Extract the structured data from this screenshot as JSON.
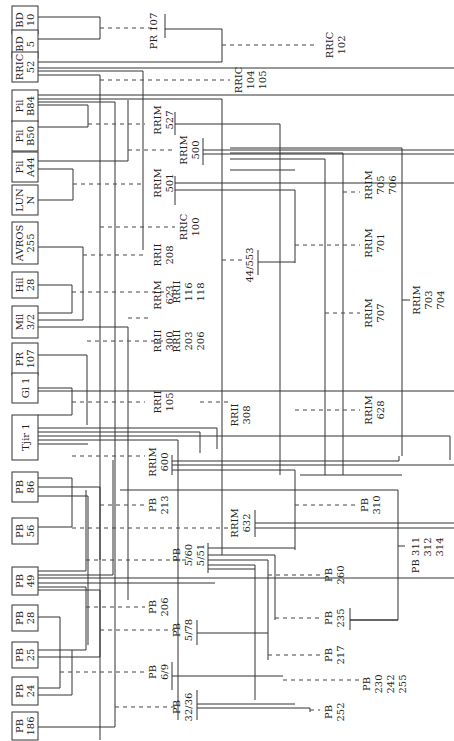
{
  "diagram": {
    "orientation": "rotated-90-ccw",
    "clones": [
      {
        "id": "bd10",
        "line1": "BD",
        "line2": "10"
      },
      {
        "id": "bd5",
        "line1": "BD",
        "line2": "5"
      },
      {
        "id": "rric52",
        "line1": "RRIC",
        "line2": "52"
      },
      {
        "id": "pilb84",
        "line1": "Pil",
        "line2": "B84"
      },
      {
        "id": "pilb50",
        "line1": "Pil",
        "line2": "B50"
      },
      {
        "id": "pila44",
        "line1": "Pil",
        "line2": "A44"
      },
      {
        "id": "lunn",
        "line1": "LUN",
        "line2": "N"
      },
      {
        "id": "avros255",
        "line1": "AVROS",
        "line2": "255"
      },
      {
        "id": "hil28",
        "line1": "Hil",
        "line2": "28"
      },
      {
        "id": "mil32",
        "line1": "Mil",
        "line2": "3/2"
      },
      {
        "id": "pr107",
        "line1": "PR",
        "line2": "107"
      },
      {
        "id": "gl1",
        "line1": "Gl 1",
        "line2": ""
      },
      {
        "id": "tjir1",
        "line1": "Tjir 1",
        "line2": ""
      },
      {
        "id": "pb86",
        "line1": "PB",
        "line2": "86"
      },
      {
        "id": "pb56",
        "line1": "PB",
        "line2": "56"
      },
      {
        "id": "pb49",
        "line1": "PB",
        "line2": "49"
      },
      {
        "id": "pb28",
        "line1": "PB",
        "line2": "28"
      },
      {
        "id": "pb25",
        "line1": "PB",
        "line2": "25"
      },
      {
        "id": "pb24",
        "line1": "PB",
        "line2": "24"
      },
      {
        "id": "pb186",
        "line1": "PB",
        "line2": "186"
      }
    ],
    "offspring_labels": [
      {
        "id": "pr107b",
        "lines": [
          "PR 107"
        ]
      },
      {
        "id": "rric102",
        "lines": [
          "RRIC",
          "102"
        ]
      },
      {
        "id": "rric104",
        "lines": [
          "RRIC",
          "104",
          "105"
        ]
      },
      {
        "id": "rrim527",
        "lines": [
          "RRIM",
          "527"
        ]
      },
      {
        "id": "rrim500",
        "lines": [
          "RRIM",
          "500"
        ]
      },
      {
        "id": "rrim501",
        "lines": [
          "RRIM",
          "501"
        ]
      },
      {
        "id": "rric100",
        "lines": [
          "RRIC",
          "100"
        ]
      },
      {
        "id": "rrii208",
        "lines": [
          "RRII",
          "208"
        ]
      },
      {
        "id": "rrim705",
        "lines": [
          "RRIM",
          "705",
          "706"
        ]
      },
      {
        "id": "rrim701",
        "lines": [
          "RRIM",
          "701"
        ]
      },
      {
        "id": "c44553",
        "lines": [
          "44/553"
        ]
      },
      {
        "id": "rrim623",
        "lines": [
          "RRIM",
          "623"
        ]
      },
      {
        "id": "rrii116",
        "lines": [
          "RRII",
          "116",
          "118"
        ]
      },
      {
        "id": "rrim707",
        "lines": [
          "RRIM",
          "707"
        ]
      },
      {
        "id": "rrim703",
        "lines": [
          "RRIM",
          "703",
          "704"
        ]
      },
      {
        "id": "rrii300",
        "lines": [
          "RRII",
          "300"
        ]
      },
      {
        "id": "rrii203",
        "lines": [
          "RRII",
          "203",
          "206"
        ]
      },
      {
        "id": "rrii105",
        "lines": [
          "RRII",
          "105"
        ]
      },
      {
        "id": "rrii308",
        "lines": [
          "RRII",
          "308"
        ]
      },
      {
        "id": "rrim628",
        "lines": [
          "RRIM",
          "628"
        ]
      },
      {
        "id": "rrim600",
        "lines": [
          "RRIM",
          "600"
        ]
      },
      {
        "id": "pb213",
        "lines": [
          "PB",
          "213"
        ]
      },
      {
        "id": "rrim632",
        "lines": [
          "RRIM",
          "632"
        ]
      },
      {
        "id": "pb310",
        "lines": [
          "PB",
          "310"
        ]
      },
      {
        "id": "pb560",
        "lines": [
          "PB",
          "5/60",
          "5/51"
        ]
      },
      {
        "id": "pb311",
        "lines": [
          "PB  311",
          "312",
          "314"
        ]
      },
      {
        "id": "pb260",
        "lines": [
          "PB",
          "260"
        ]
      },
      {
        "id": "pb206",
        "lines": [
          "PB",
          "206"
        ]
      },
      {
        "id": "pb578",
        "lines": [
          "PB",
          "5/78"
        ]
      },
      {
        "id": "pb235",
        "lines": [
          "PB",
          "235"
        ]
      },
      {
        "id": "pb217",
        "lines": [
          "PB",
          "217"
        ]
      },
      {
        "id": "pb69",
        "lines": [
          "PB",
          "6/9"
        ]
      },
      {
        "id": "pb230",
        "lines": [
          "PB",
          "230",
          "242",
          "255"
        ]
      },
      {
        "id": "pb3236",
        "lines": [
          "PB",
          "32/36"
        ]
      },
      {
        "id": "pb252",
        "lines": [
          "PB",
          "252"
        ]
      }
    ]
  }
}
